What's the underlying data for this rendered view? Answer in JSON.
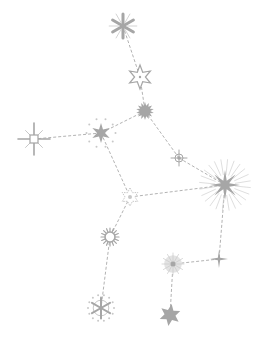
{
  "image": {
    "title": "Constellation illustration",
    "width": 262,
    "height": 344,
    "background": "#ffffff"
  },
  "colors": {
    "star_fill": "#a6a6a6",
    "star_light": "#c8c8c8",
    "line": "#b3b3b3"
  },
  "stars": [
    {
      "id": "a",
      "type": "asterisk-6",
      "x": 123,
      "y": 26,
      "r": 12
    },
    {
      "id": "b",
      "type": "outline-star-6",
      "x": 140,
      "y": 77,
      "r": 12
    },
    {
      "id": "c",
      "type": "sunburst",
      "x": 145,
      "y": 111,
      "r": 9
    },
    {
      "id": "d",
      "type": "sparkle-8-hollow",
      "x": 34,
      "y": 139,
      "r": 16
    },
    {
      "id": "e",
      "type": "star-6-dotted",
      "x": 101,
      "y": 133,
      "r": 10
    },
    {
      "id": "f",
      "type": "crosshair",
      "x": 179,
      "y": 158,
      "r": 8
    },
    {
      "id": "g",
      "type": "burst-8-rays",
      "x": 225,
      "y": 185,
      "r": 15
    },
    {
      "id": "h",
      "type": "faint-star",
      "x": 130,
      "y": 197,
      "r": 9
    },
    {
      "id": "i",
      "type": "sun-ring",
      "x": 110,
      "y": 237,
      "r": 9
    },
    {
      "id": "j",
      "type": "glow",
      "x": 173,
      "y": 264,
      "r": 11
    },
    {
      "id": "k",
      "type": "sparkle-4",
      "x": 219,
      "y": 259,
      "r": 9
    },
    {
      "id": "l",
      "type": "asterisk-dotted-circle",
      "x": 101,
      "y": 308,
      "r": 13
    },
    {
      "id": "m",
      "type": "filled-star-6",
      "x": 170,
      "y": 315,
      "r": 11
    }
  ],
  "links": [
    [
      "a",
      "b"
    ],
    [
      "b",
      "c"
    ],
    [
      "c",
      "e"
    ],
    [
      "e",
      "d"
    ],
    [
      "c",
      "f"
    ],
    [
      "f",
      "g"
    ],
    [
      "e",
      "h"
    ],
    [
      "h",
      "g"
    ],
    [
      "h",
      "i"
    ],
    [
      "i",
      "l"
    ],
    [
      "g",
      "k"
    ],
    [
      "k",
      "j"
    ],
    [
      "j",
      "m"
    ]
  ]
}
